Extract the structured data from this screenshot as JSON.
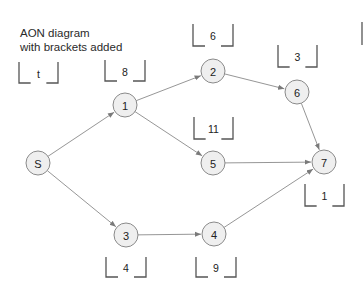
{
  "title": {
    "line1": "AON diagram",
    "line2": "with brackets added"
  },
  "colors": {
    "node_fill": "#efefef",
    "node_stroke": "#8a8a8a",
    "edge": "#8a8a8a",
    "bracket": "#555555"
  },
  "nodes": [
    {
      "id": "S",
      "label": "S",
      "x": 38,
      "y": 163
    },
    {
      "id": "1",
      "label": "1",
      "x": 125,
      "y": 105
    },
    {
      "id": "2",
      "label": "2",
      "x": 213,
      "y": 71
    },
    {
      "id": "3",
      "label": "3",
      "x": 126,
      "y": 235
    },
    {
      "id": "4",
      "label": "4",
      "x": 214,
      "y": 234
    },
    {
      "id": "5",
      "label": "5",
      "x": 213,
      "y": 163
    },
    {
      "id": "6",
      "label": "6",
      "x": 297,
      "y": 92
    },
    {
      "id": "7",
      "label": "7",
      "x": 324,
      "y": 162
    }
  ],
  "edges": [
    {
      "from": "S",
      "to": "1"
    },
    {
      "from": "S",
      "to": "3"
    },
    {
      "from": "1",
      "to": "2"
    },
    {
      "from": "1",
      "to": "5"
    },
    {
      "from": "2",
      "to": "6"
    },
    {
      "from": "3",
      "to": "4"
    },
    {
      "from": "5",
      "to": "7"
    },
    {
      "from": "6",
      "to": "7"
    },
    {
      "from": "4",
      "to": "7"
    }
  ],
  "brackets": [
    {
      "label": "t",
      "x": 19,
      "y": 62,
      "w": 39,
      "h": 21
    },
    {
      "label": "8",
      "x": 105,
      "y": 60,
      "w": 40,
      "h": 21
    },
    {
      "label": "6",
      "x": 193,
      "y": 24,
      "w": 40,
      "h": 22
    },
    {
      "label": "3",
      "x": 278,
      "y": 45,
      "w": 39,
      "h": 22
    },
    {
      "label": "11",
      "x": 194,
      "y": 117,
      "w": 39,
      "h": 22
    },
    {
      "label": "1",
      "x": 305,
      "y": 184,
      "w": 39,
      "h": 22
    },
    {
      "label": "4",
      "x": 106,
      "y": 257,
      "w": 40,
      "h": 20
    },
    {
      "label": "9",
      "x": 196,
      "y": 257,
      "w": 40,
      "h": 20
    }
  ],
  "partial_bracket_edge": {
    "x": 362,
    "y1": 22,
    "y2": 45
  }
}
